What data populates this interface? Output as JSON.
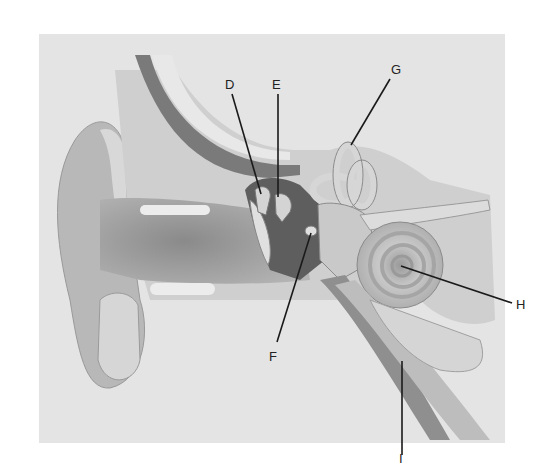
{
  "diagram": {
    "background_color": "#e4e4e4",
    "labels": [
      {
        "id": "D",
        "text": "D",
        "x": 225,
        "y": 78,
        "line": [
          232,
          94,
          261,
          194
        ]
      },
      {
        "id": "E",
        "text": "E",
        "x": 272,
        "y": 78,
        "line": [
          278,
          94,
          278,
          197
        ]
      },
      {
        "id": "G",
        "text": "G",
        "x": 391,
        "y": 63,
        "line": [
          390,
          79,
          351,
          145
        ]
      },
      {
        "id": "F",
        "text": "F",
        "x": 269,
        "y": 350,
        "line": [
          311,
          233,
          277,
          342
        ]
      },
      {
        "id": "H",
        "text": "H",
        "x": 516,
        "y": 298,
        "line": [
          401,
          266,
          512,
          303
        ]
      },
      {
        "id": "I",
        "text": "I",
        "x": 399,
        "y": 455,
        "line": [
          402,
          361,
          402,
          455
        ]
      }
    ]
  }
}
